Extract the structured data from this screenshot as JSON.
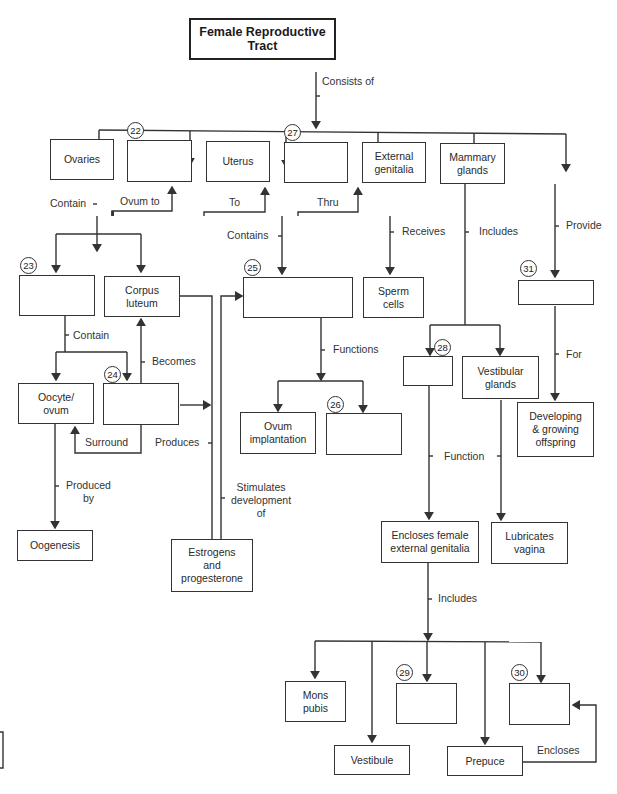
{
  "diagram": {
    "title": "Female Reproductive\nTract",
    "nodes": {
      "ovaries": "Ovaries",
      "blank22": "",
      "uterus": "Uterus",
      "blank27": "",
      "external_genitalia": "External\ngenitalia",
      "mammary_glands": "Mammary\nglands",
      "blank23": "",
      "corpus_luteum": "Corpus\nluteum",
      "blank25": "",
      "sperm_cells": "Sperm\ncells",
      "blank31": "",
      "oocyte_ovum": "Oocyte/\novum",
      "blank24": "",
      "ovum_implantation": "Ovum\nimplantation",
      "blank26": "",
      "blank28": "",
      "vestibular_glands": "Vestibular\nglands",
      "developing_offspring": "Developing\n& growing\noffspring",
      "oogenesis": "Oogenesis",
      "estrogens_progesterone": "Estrogens\nand\nprogesterone",
      "encloses_female": "Encloses female\nexternal genitalia",
      "lubricates_vagina": "Lubricates\nvagina",
      "mons_pubis": "Mons\npubis",
      "blank29": "",
      "blank30": "",
      "vestibule": "Vestibule",
      "prepuce": "Prepuce"
    },
    "numbers": {
      "n22": "22",
      "n23": "23",
      "n24": "24",
      "n25": "25",
      "n26": "26",
      "n27": "27",
      "n28": "28",
      "n29": "29",
      "n30": "30",
      "n31": "31"
    },
    "links": {
      "consists_of": "Consists of",
      "contain": "Contain",
      "ovum_to": "Ovum to",
      "to": "To",
      "thru": "Thru",
      "contains": "Contains",
      "receives": "Receives",
      "includes_top": "Includes",
      "provide": "Provide",
      "contain2": "Contain",
      "becomes": "Becomes",
      "functions": "Functions",
      "for": "For",
      "surround": "Surround",
      "produces": "Produces",
      "produced_by": "Produced\nby",
      "stimulates": "Stimulates\ndevelopment\nof",
      "function": "Function",
      "includes_bottom": "Includes",
      "encloses": "Encloses"
    }
  }
}
